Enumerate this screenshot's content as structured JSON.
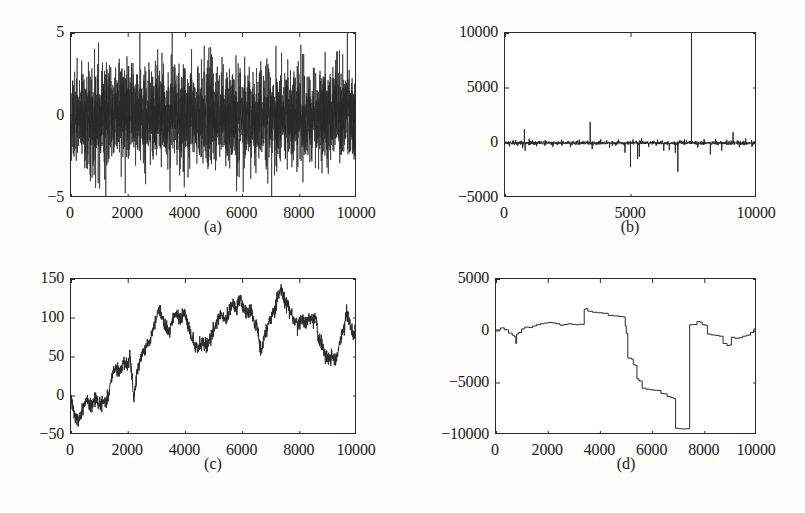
{
  "figure": {
    "background_color": "#fdfdfc",
    "line_color": "#2a2a2a",
    "axis_color": "#2a2a2a",
    "panel_count": 4
  },
  "chart_data": [
    {
      "type": "line",
      "panel": "a",
      "caption": "(a)",
      "title": "",
      "xlabel": "",
      "ylabel": "",
      "description": "Dense zero-mean white-noise-like signal filling the band between about -5 and 5",
      "xlim": [
        0,
        10000
      ],
      "ylim": [
        -5,
        5
      ],
      "xticks": [
        0,
        2000,
        4000,
        6000,
        8000,
        10000
      ],
      "xtick_labels": [
        "0",
        "2000",
        "4000",
        "6000",
        "8000",
        "10000"
      ],
      "yticks": [
        -5,
        0,
        5
      ],
      "ytick_labels": [
        "-5",
        "0",
        "5"
      ],
      "grid": false,
      "legend": "none",
      "series_kind": "noise",
      "noise": {
        "n_points": 3000,
        "mean": 0,
        "std": 1.45,
        "clip": [
          -5,
          5
        ],
        "seed": 20110
      }
    },
    {
      "type": "line",
      "panel": "b",
      "caption": "(b)",
      "title": "",
      "xlabel": "",
      "ylabel": "",
      "description": "Sparse impulse series near zero with isolated positive and negative spikes and one very large clipped spike near x = 7400",
      "xlim": [
        0,
        10000
      ],
      "ylim": [
        -5000,
        10000
      ],
      "xticks": [
        0,
        5000,
        10000
      ],
      "xtick_labels": [
        "0",
        "5000",
        "10000"
      ],
      "yticks": [
        -5000,
        0,
        5000,
        10000
      ],
      "ytick_labels": [
        "-5000",
        "0",
        "5000",
        "10000"
      ],
      "grid": false,
      "legend": "none",
      "series_kind": "impulses",
      "baseline_noise": {
        "n_points": 1200,
        "std": 90,
        "seed": 7741
      },
      "impulses": [
        {
          "x": 180,
          "y": -320
        },
        {
          "x": 420,
          "y": 260
        },
        {
          "x": 700,
          "y": -480
        },
        {
          "x": 770,
          "y": 1250
        },
        {
          "x": 800,
          "y": -700
        },
        {
          "x": 960,
          "y": 380
        },
        {
          "x": 1250,
          "y": -300
        },
        {
          "x": 1600,
          "y": 260
        },
        {
          "x": 1900,
          "y": -340
        },
        {
          "x": 2250,
          "y": 300
        },
        {
          "x": 2600,
          "y": -380
        },
        {
          "x": 2950,
          "y": 300
        },
        {
          "x": 3380,
          "y": 1900
        },
        {
          "x": 3460,
          "y": -560
        },
        {
          "x": 3800,
          "y": 330
        },
        {
          "x": 4150,
          "y": -420
        },
        {
          "x": 4500,
          "y": 300
        },
        {
          "x": 4760,
          "y": -880
        },
        {
          "x": 4980,
          "y": -2200
        },
        {
          "x": 5080,
          "y": 320
        },
        {
          "x": 5260,
          "y": -1450
        },
        {
          "x": 5330,
          "y": -1250
        },
        {
          "x": 5420,
          "y": 420
        },
        {
          "x": 5700,
          "y": -360
        },
        {
          "x": 6050,
          "y": 300
        },
        {
          "x": 6300,
          "y": -700
        },
        {
          "x": 6520,
          "y": -640
        },
        {
          "x": 6760,
          "y": -900
        },
        {
          "x": 6860,
          "y": -2600
        },
        {
          "x": 7120,
          "y": 340
        },
        {
          "x": 7400,
          "y": 12000
        },
        {
          "x": 7650,
          "y": -420
        },
        {
          "x": 7900,
          "y": 360
        },
        {
          "x": 8150,
          "y": -1050
        },
        {
          "x": 8350,
          "y": 330
        },
        {
          "x": 8600,
          "y": -700
        },
        {
          "x": 8800,
          "y": 300
        },
        {
          "x": 9050,
          "y": 980
        },
        {
          "x": 9300,
          "y": -400
        },
        {
          "x": 9550,
          "y": 420
        },
        {
          "x": 9800,
          "y": -350
        }
      ]
    },
    {
      "type": "line",
      "panel": "c",
      "caption": "(c)",
      "title": "",
      "xlabel": "",
      "ylabel": "",
      "description": "Noisy random walk that dips to about -35 early then climbs and oscillates between roughly 45 and 135",
      "xlim": [
        0,
        10000
      ],
      "ylim": [
        -50,
        150
      ],
      "xticks": [
        0,
        2000,
        4000,
        6000,
        8000,
        10000
      ],
      "xtick_labels": [
        "0",
        "2000",
        "4000",
        "6000",
        "8000",
        "10000"
      ],
      "yticks": [
        -50,
        0,
        50,
        100,
        150
      ],
      "ytick_labels": [
        "-50",
        "0",
        "50",
        "100",
        "150"
      ],
      "grid": false,
      "legend": "none",
      "series_kind": "random-walk",
      "control_points": [
        {
          "x": 0,
          "y": 0
        },
        {
          "x": 120,
          "y": -22
        },
        {
          "x": 250,
          "y": -35
        },
        {
          "x": 400,
          "y": -18
        },
        {
          "x": 560,
          "y": -5
        },
        {
          "x": 700,
          "y": -14
        },
        {
          "x": 850,
          "y": -2
        },
        {
          "x": 1000,
          "y": -12
        },
        {
          "x": 1150,
          "y": -8
        },
        {
          "x": 1300,
          "y": -4
        },
        {
          "x": 1420,
          "y": 25
        },
        {
          "x": 1560,
          "y": 36
        },
        {
          "x": 1700,
          "y": 30
        },
        {
          "x": 1850,
          "y": 45
        },
        {
          "x": 1980,
          "y": 36
        },
        {
          "x": 2060,
          "y": 55
        },
        {
          "x": 2140,
          "y": 20
        },
        {
          "x": 2200,
          "y": -3
        },
        {
          "x": 2300,
          "y": 30
        },
        {
          "x": 2450,
          "y": 48
        },
        {
          "x": 2600,
          "y": 62
        },
        {
          "x": 2750,
          "y": 70
        },
        {
          "x": 2900,
          "y": 88
        },
        {
          "x": 3020,
          "y": 105
        },
        {
          "x": 3120,
          "y": 112
        },
        {
          "x": 3220,
          "y": 96
        },
        {
          "x": 3340,
          "y": 88
        },
        {
          "x": 3460,
          "y": 82
        },
        {
          "x": 3560,
          "y": 100
        },
        {
          "x": 3700,
          "y": 104
        },
        {
          "x": 3820,
          "y": 98
        },
        {
          "x": 3960,
          "y": 106
        },
        {
          "x": 4080,
          "y": 92
        },
        {
          "x": 4200,
          "y": 78
        },
        {
          "x": 4330,
          "y": 66
        },
        {
          "x": 4450,
          "y": 60
        },
        {
          "x": 4600,
          "y": 70
        },
        {
          "x": 4720,
          "y": 64
        },
        {
          "x": 4850,
          "y": 72
        },
        {
          "x": 4980,
          "y": 82
        },
        {
          "x": 5120,
          "y": 96
        },
        {
          "x": 5250,
          "y": 108
        },
        {
          "x": 5380,
          "y": 98
        },
        {
          "x": 5500,
          "y": 104
        },
        {
          "x": 5640,
          "y": 118
        },
        {
          "x": 5780,
          "y": 112
        },
        {
          "x": 5900,
          "y": 126
        },
        {
          "x": 6020,
          "y": 114
        },
        {
          "x": 6150,
          "y": 104
        },
        {
          "x": 6280,
          "y": 112
        },
        {
          "x": 6400,
          "y": 96
        },
        {
          "x": 6520,
          "y": 86
        },
        {
          "x": 6650,
          "y": 58
        },
        {
          "x": 6760,
          "y": 76
        },
        {
          "x": 6880,
          "y": 90
        },
        {
          "x": 7000,
          "y": 102
        },
        {
          "x": 7120,
          "y": 112
        },
        {
          "x": 7250,
          "y": 128
        },
        {
          "x": 7360,
          "y": 136
        },
        {
          "x": 7460,
          "y": 124
        },
        {
          "x": 7580,
          "y": 118
        },
        {
          "x": 7700,
          "y": 104
        },
        {
          "x": 7820,
          "y": 96
        },
        {
          "x": 7950,
          "y": 88
        },
        {
          "x": 8080,
          "y": 100
        },
        {
          "x": 8200,
          "y": 92
        },
        {
          "x": 8320,
          "y": 102
        },
        {
          "x": 8450,
          "y": 96
        },
        {
          "x": 8560,
          "y": 104
        },
        {
          "x": 8640,
          "y": 74
        },
        {
          "x": 8760,
          "y": 64
        },
        {
          "x": 8880,
          "y": 56
        },
        {
          "x": 9000,
          "y": 46
        },
        {
          "x": 9120,
          "y": 52
        },
        {
          "x": 9240,
          "y": 44
        },
        {
          "x": 9380,
          "y": 66
        },
        {
          "x": 9520,
          "y": 86
        },
        {
          "x": 9640,
          "y": 108
        },
        {
          "x": 9740,
          "y": 96
        },
        {
          "x": 9850,
          "y": 78
        },
        {
          "x": 9940,
          "y": 86
        },
        {
          "x": 10000,
          "y": 80
        }
      ],
      "jitter": {
        "std": 4.5,
        "seed": 3321,
        "n_points": 1600
      }
    },
    {
      "type": "line",
      "panel": "d",
      "caption": "(d)",
      "title": "",
      "xlabel": "",
      "ylabel": "",
      "description": "Cumulative sum of the impulse series: a staircase that drifts near zero, steps down to about -9400 near x = 7000, then jumps back up near x = 7400",
      "xlim": [
        0,
        10000
      ],
      "ylim": [
        -10000,
        5000
      ],
      "xticks": [
        0,
        2000,
        4000,
        6000,
        8000,
        10000
      ],
      "xtick_labels": [
        "0",
        "2000",
        "4000",
        "6000",
        "8000",
        "10000"
      ],
      "yticks": [
        -10000,
        -5000,
        0,
        5000
      ],
      "ytick_labels": [
        "-10000",
        "-5000",
        "0",
        "5000"
      ],
      "grid": false,
      "legend": "none",
      "series_kind": "staircase",
      "control_points": [
        {
          "x": 0,
          "y": 100
        },
        {
          "x": 180,
          "y": 300
        },
        {
          "x": 320,
          "y": 120
        },
        {
          "x": 480,
          "y": -200
        },
        {
          "x": 620,
          "y": -400
        },
        {
          "x": 700,
          "y": -560
        },
        {
          "x": 760,
          "y": -1200
        },
        {
          "x": 790,
          "y": -300
        },
        {
          "x": 860,
          "y": -150
        },
        {
          "x": 980,
          "y": 200
        },
        {
          "x": 1100,
          "y": 380
        },
        {
          "x": 1250,
          "y": 330
        },
        {
          "x": 1400,
          "y": 480
        },
        {
          "x": 1550,
          "y": 600
        },
        {
          "x": 1700,
          "y": 700
        },
        {
          "x": 1850,
          "y": 760
        },
        {
          "x": 2000,
          "y": 820
        },
        {
          "x": 2150,
          "y": 780
        },
        {
          "x": 2300,
          "y": 700
        },
        {
          "x": 2450,
          "y": 560
        },
        {
          "x": 2600,
          "y": 620
        },
        {
          "x": 2750,
          "y": 700
        },
        {
          "x": 2900,
          "y": 640
        },
        {
          "x": 3050,
          "y": 600
        },
        {
          "x": 3200,
          "y": 650
        },
        {
          "x": 3340,
          "y": 620
        },
        {
          "x": 3380,
          "y": 2100
        },
        {
          "x": 3450,
          "y": 2150
        },
        {
          "x": 3520,
          "y": 1900
        },
        {
          "x": 3700,
          "y": 1800
        },
        {
          "x": 3900,
          "y": 1750
        },
        {
          "x": 4100,
          "y": 1700
        },
        {
          "x": 4300,
          "y": 1500
        },
        {
          "x": 4500,
          "y": 1450
        },
        {
          "x": 4700,
          "y": 1400
        },
        {
          "x": 4850,
          "y": 1350
        },
        {
          "x": 4950,
          "y": 500
        },
        {
          "x": 4990,
          "y": -250
        },
        {
          "x": 5050,
          "y": -2600
        },
        {
          "x": 5180,
          "y": -2700
        },
        {
          "x": 5260,
          "y": -3200
        },
        {
          "x": 5320,
          "y": -3300
        },
        {
          "x": 5400,
          "y": -4600
        },
        {
          "x": 5480,
          "y": -4800
        },
        {
          "x": 5600,
          "y": -5500
        },
        {
          "x": 5750,
          "y": -5600
        },
        {
          "x": 5900,
          "y": -5650
        },
        {
          "x": 6050,
          "y": -5700
        },
        {
          "x": 6200,
          "y": -5720
        },
        {
          "x": 6320,
          "y": -6000
        },
        {
          "x": 6450,
          "y": -6050
        },
        {
          "x": 6560,
          "y": -6300
        },
        {
          "x": 6700,
          "y": -6400
        },
        {
          "x": 6800,
          "y": -6500
        },
        {
          "x": 6880,
          "y": -9350
        },
        {
          "x": 7000,
          "y": -9400
        },
        {
          "x": 7150,
          "y": -9420
        },
        {
          "x": 7300,
          "y": -9400
        },
        {
          "x": 7390,
          "y": -9400
        },
        {
          "x": 7420,
          "y": 600
        },
        {
          "x": 7550,
          "y": 620
        },
        {
          "x": 7700,
          "y": 900
        },
        {
          "x": 7820,
          "y": 850
        },
        {
          "x": 7900,
          "y": 600
        },
        {
          "x": 8000,
          "y": 560
        },
        {
          "x": 8100,
          "y": -300
        },
        {
          "x": 8250,
          "y": -380
        },
        {
          "x": 8400,
          "y": -420
        },
        {
          "x": 8550,
          "y": -500
        },
        {
          "x": 8700,
          "y": -1200
        },
        {
          "x": 8850,
          "y": -1400
        },
        {
          "x": 8950,
          "y": -1350
        },
        {
          "x": 9020,
          "y": -600
        },
        {
          "x": 9150,
          "y": -700
        },
        {
          "x": 9300,
          "y": -650
        },
        {
          "x": 9450,
          "y": -500
        },
        {
          "x": 9600,
          "y": -400
        },
        {
          "x": 9750,
          "y": -150
        },
        {
          "x": 9880,
          "y": 200
        },
        {
          "x": 10000,
          "y": 100
        }
      ]
    }
  ]
}
